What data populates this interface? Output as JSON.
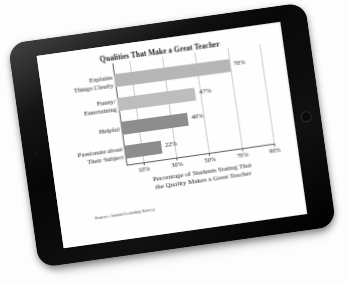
{
  "device": {
    "name": "tablet",
    "bezel_color": "#0b0b0b",
    "home_button": "home-button-icon",
    "camera": "front-camera-icon"
  },
  "chart_data": {
    "type": "bar",
    "orientation": "horizontal",
    "title": "Qualities That Make a Great Teacher",
    "categories": [
      "Explains Things Clearly",
      "Funny/ Entertaining",
      "Helpful",
      "Passionate about Their Subject"
    ],
    "category_lines": [
      [
        "Explains",
        "Things Clearly"
      ],
      [
        "Funny/",
        "Entertaining"
      ],
      [
        "Helpful"
      ],
      [
        "Passionate about",
        "Their Subject"
      ]
    ],
    "values": [
      70,
      47,
      40,
      22
    ],
    "value_labels": [
      "70%",
      "47%",
      "40%",
      "22%"
    ],
    "bar_colors": [
      "#b6b6b6",
      "#bdbdbd",
      "#8d8d8d",
      "#8d8d8d"
    ],
    "xlabel": "Percentage of Students Stating That the Quality Makes a Great Teacher",
    "xlabel_lines": [
      "Percentage of Students Stating That",
      "the Quality Makes a Great Teacher"
    ],
    "ylabel": "",
    "xlim": [
      0,
      90
    ],
    "xticks": [
      10,
      30,
      50,
      70,
      90
    ],
    "xtick_labels": [
      "10%",
      "30%",
      "50%",
      "70%",
      "90%"
    ],
    "grid": true,
    "grid_axis": "x",
    "legend": false,
    "source": "Source: Avanta Learning Survey"
  }
}
